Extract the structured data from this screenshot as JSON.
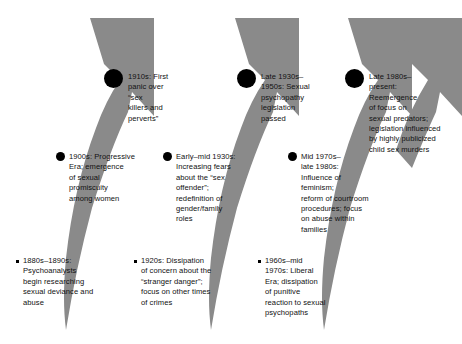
{
  "diagram": {
    "type": "timeline-arrows",
    "arrow_color": "#8a8a8a",
    "text_color": "#111111",
    "background": "#ffffff",
    "arrow_count": 4,
    "entries": [
      {
        "id": "1910s",
        "marker": "large-circle",
        "text": "1910s: First\npanic over “sex\nkillers and\nperverts”"
      },
      {
        "id": "late-1930s-1950s",
        "marker": "large-circle",
        "text": "Late 1930s–\n1950s: Sexual\npsychopathy\nlegislation\npassed"
      },
      {
        "id": "late-1980s-present",
        "marker": "large-circle",
        "text": "Late 1980s–\npresent:\nReemergence\nof focus on\nsexual predators;\nlegislation influenced\nby highly publicized\nchild sex murders"
      },
      {
        "id": "1900s",
        "marker": "medium-circle",
        "text": "1900s: Progressive\nEra; emergence\nof sexual\npromiscuity\namong women"
      },
      {
        "id": "early-mid-1930s",
        "marker": "medium-circle",
        "text": "Early–mid 1930s:\nIncreasing fears\nabout the “sex\noffender”;\nredefinition of\ngender/family\nroles"
      },
      {
        "id": "mid-1970s-late-1980s",
        "marker": "medium-circle",
        "text": "Mid 1970s–\nlate 1980s:\nInfluence of\nfeminism;\nreform of courtroom\nprocedures; focus\non abuse within\nfamilies"
      },
      {
        "id": "1880s-1890s",
        "marker": "small-square",
        "text": "1880s–1890s:\nPsychoanalysts\nbegin researching\nsexual deviance and\nabuse"
      },
      {
        "id": "1920s",
        "marker": "small-square",
        "text": "1920s: Dissipation\nof concern about the\n“stranger danger”;\nfocus on other times\nof crimes"
      },
      {
        "id": "1960s-mid-1970s",
        "marker": "small-square",
        "text": "1960s–mid\n1970s: Liberal\nEra; dissipation\nof punitive\nreaction to sexual\npsychopaths"
      }
    ]
  }
}
